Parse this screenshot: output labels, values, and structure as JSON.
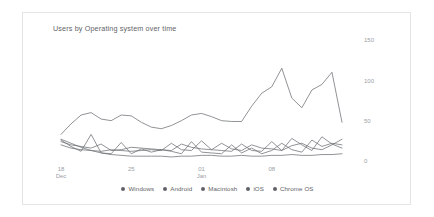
{
  "card": {
    "title": "Users by Operating system over time",
    "background": "#ffffff",
    "border_color": "#e4e4e4"
  },
  "legend": {
    "position": "bottom-center",
    "items": [
      {
        "label": "Windows",
        "color": "#5f6368",
        "dot": "legend-dot-windows"
      },
      {
        "label": "Android",
        "color": "#5f6368",
        "dot": "legend-dot-android"
      },
      {
        "label": "Macintosh",
        "color": "#5f6368",
        "dot": "legend-dot-macintosh"
      },
      {
        "label": "iOS",
        "color": "#5f6368",
        "dot": "legend-dot-ios"
      },
      {
        "label": "Chrome OS",
        "color": "#5f6368",
        "dot": "legend-dot-chrome-os"
      }
    ]
  },
  "axes": {
    "y_ticks": [
      "0",
      "50",
      "100",
      "150"
    ],
    "y_tick_values": [
      0,
      50,
      100,
      150
    ],
    "y_axis_side": "right",
    "x_ticks": [
      {
        "line1": "18",
        "line2": "Dec",
        "index": 0
      },
      {
        "line1": "25",
        "line2": "",
        "index": 7
      },
      {
        "line1": "01",
        "line2": "Jan",
        "index": 14
      },
      {
        "line1": "08",
        "line2": "",
        "index": 21
      }
    ]
  },
  "chart_data": {
    "type": "line",
    "title": "Users by Operating system over time",
    "xlabel": "",
    "ylabel": "",
    "ylim": [
      0,
      150
    ],
    "grid": false,
    "legend_position": "bottom",
    "x": [
      "18 Dec",
      "19 Dec",
      "20 Dec",
      "21 Dec",
      "22 Dec",
      "23 Dec",
      "24 Dec",
      "25 Dec",
      "26 Dec",
      "27 Dec",
      "28 Dec",
      "29 Dec",
      "30 Dec",
      "31 Dec",
      "01 Jan",
      "02 Jan",
      "03 Jan",
      "04 Jan",
      "05 Jan",
      "06 Jan",
      "07 Jan",
      "08 Jan",
      "09 Jan",
      "10 Jan",
      "11 Jan",
      "12 Jan",
      "13 Jan",
      "14 Jan",
      "15 Jan"
    ],
    "series": [
      {
        "name": "Windows",
        "color": "#6b6f73",
        "values": [
          33,
          46,
          57,
          60,
          52,
          50,
          57,
          56,
          48,
          42,
          40,
          44,
          50,
          57,
          59,
          55,
          50,
          49,
          49,
          68,
          84,
          92,
          115,
          78,
          66,
          88,
          95,
          110,
          48
        ]
      },
      {
        "name": "Android",
        "color": "#6b6f73",
        "values": [
          26,
          18,
          12,
          33,
          10,
          9,
          23,
          9,
          15,
          11,
          14,
          12,
          9,
          24,
          11,
          10,
          9,
          20,
          10,
          16,
          9,
          13,
          22,
          14,
          11,
          26,
          18,
          22,
          20
        ]
      },
      {
        "name": "Macintosh",
        "color": "#6b6f73",
        "values": [
          24,
          20,
          18,
          16,
          21,
          13,
          14,
          17,
          16,
          15,
          14,
          13,
          21,
          17,
          15,
          14,
          22,
          15,
          13,
          20,
          16,
          15,
          13,
          19,
          22,
          16,
          14,
          20,
          27
        ]
      },
      {
        "name": "iOS",
        "color": "#6b6f73",
        "values": [
          20,
          16,
          14,
          13,
          12,
          14,
          13,
          12,
          13,
          14,
          13,
          22,
          14,
          13,
          25,
          14,
          13,
          12,
          21,
          13,
          12,
          24,
          13,
          28,
          20,
          13,
          30,
          21,
          16
        ]
      },
      {
        "name": "Chrome OS",
        "color": "#6b6f73",
        "values": [
          27,
          22,
          17,
          13,
          10,
          8,
          7,
          6,
          6,
          6,
          6,
          5,
          6,
          6,
          7,
          7,
          6,
          6,
          7,
          6,
          6,
          7,
          7,
          8,
          7,
          7,
          8,
          8,
          9
        ]
      }
    ]
  }
}
